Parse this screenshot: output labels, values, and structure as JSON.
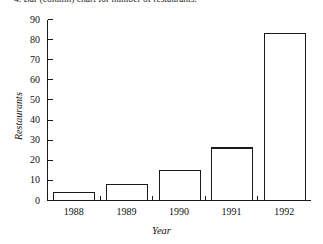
{
  "caption": {
    "text": "4. Bar (column) chart for number of restaurants."
  },
  "chart_data": {
    "type": "bar",
    "title": "",
    "xlabel": "Year",
    "ylabel": "Restaurants",
    "categories": [
      "1988",
      "1989",
      "1990",
      "1991",
      "1992"
    ],
    "values": [
      4,
      8,
      15,
      26,
      83
    ],
    "ylim": [
      0,
      90
    ],
    "yticks": [
      0,
      10,
      20,
      30,
      40,
      50,
      60,
      70,
      80,
      90
    ],
    "ytick_labels": [
      "0",
      "10",
      "20",
      "30",
      "40",
      "50",
      "60",
      "70",
      "80",
      "90"
    ],
    "xtick_labels": [
      "1988",
      "1989",
      "1990",
      "1991",
      "1992"
    ],
    "grid": false,
    "legend": null,
    "bar_fill_color": "#ffffff",
    "bar_edge_color": "#1a1a1a",
    "axis_color": "#1a1a1a",
    "background_color": "#ffffff"
  }
}
